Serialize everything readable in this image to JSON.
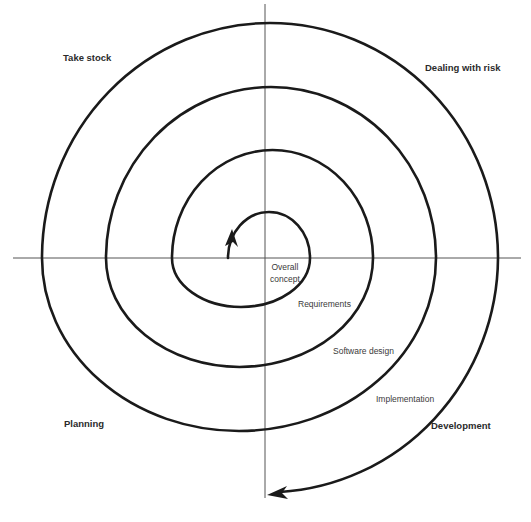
{
  "diagram": {
    "type": "spiral-model",
    "quadrants": {
      "top_left": "Take stock",
      "top_right": "Dealing with risk",
      "bottom_left": "Planning",
      "bottom_right": "Development"
    },
    "phases": [
      {
        "line1": "Overall",
        "line2": "concept"
      },
      {
        "label": "Requirements"
      },
      {
        "label": "Software design"
      },
      {
        "label": "Implementation"
      }
    ],
    "colors": {
      "spiral": "#1a1a1a",
      "axes": "#555555",
      "text": "#2b2b2b",
      "background": "#ffffff"
    }
  }
}
